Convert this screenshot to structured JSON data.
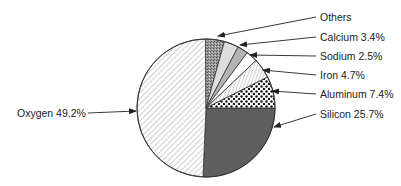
{
  "chart_data": {
    "type": "pie",
    "title": "",
    "slices": [
      {
        "name": "Silicon",
        "label": "Silicon 25.7%",
        "value": 25.7,
        "pattern": "dark-gray"
      },
      {
        "name": "Oxygen",
        "label": "Oxygen 49.2%",
        "value": 49.2,
        "pattern": "diagonal-hatch"
      },
      {
        "name": "Others",
        "label": "Others",
        "value": 7.1,
        "pattern": "stipple"
      },
      {
        "name": "Calcium",
        "label": "Calcium 3.4%",
        "value": 3.4,
        "pattern": "light-gray"
      },
      {
        "name": "Sodium",
        "label": "Sodium 2.5%",
        "value": 2.5,
        "pattern": "medium-gray"
      },
      {
        "name": "Iron",
        "label": "Iron 4.7%",
        "value": 4.7,
        "pattern": "vertical-hatch"
      },
      {
        "name": "Aluminum",
        "label": "Aluminum 7.4%",
        "value": 7.4,
        "pattern": "dots"
      }
    ],
    "legend": "callout-labels"
  }
}
